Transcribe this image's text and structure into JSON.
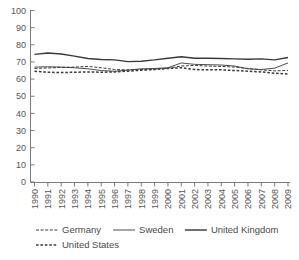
{
  "chart_data": {
    "type": "line",
    "title": "",
    "subtitle": "",
    "xlabel": "",
    "ylabel": "",
    "ylim": [
      0,
      100
    ],
    "ytick_values": [
      0,
      10,
      20,
      30,
      40,
      50,
      60,
      70,
      80,
      90,
      100
    ],
    "ytick_labels": [
      "0",
      "10",
      "20",
      "30",
      "40",
      "50",
      "60",
      "70",
      "80",
      "90",
      "100"
    ],
    "grid": false,
    "legend_position": "bottom",
    "categories": [
      "1990",
      "1991",
      "1992",
      "1993",
      "1994",
      "1995",
      "1996",
      "1997",
      "1998",
      "1999",
      "2000",
      "2001",
      "2002",
      "2003",
      "2004",
      "2005",
      "2006",
      "2007",
      "2008",
      "2009"
    ],
    "x": [
      1990,
      1991,
      1992,
      1993,
      1994,
      1995,
      1996,
      1997,
      1998,
      1999,
      2000,
      2001,
      2002,
      2003,
      2004,
      2005,
      2006,
      2007,
      2008,
      2009
    ],
    "series": [
      {
        "name": "Germany",
        "style": "dashed-thin",
        "color": "#3a3a3a",
        "values": [
          66.2,
          66.5,
          66.8,
          67.0,
          67.4,
          66.6,
          65.6,
          65.4,
          65.6,
          65.8,
          66.4,
          67.6,
          68.0,
          67.6,
          67.4,
          67.0,
          66.2,
          65.4,
          64.8,
          65.0
        ]
      },
      {
        "name": "Sweden",
        "style": "solid-thin",
        "color": "#3a3a3a",
        "values": [
          67.0,
          67.2,
          67.0,
          66.6,
          66.0,
          65.0,
          64.6,
          65.2,
          66.0,
          66.2,
          66.6,
          69.4,
          68.6,
          68.4,
          68.2,
          67.6,
          66.0,
          65.6,
          66.4,
          69.4
        ]
      },
      {
        "name": "United Kingdom",
        "style": "solid-thick",
        "color": "#2b2b2b",
        "values": [
          74.4,
          75.2,
          74.6,
          73.4,
          72.0,
          71.4,
          71.2,
          70.2,
          70.4,
          71.2,
          72.2,
          73.0,
          72.2,
          72.2,
          72.0,
          71.8,
          71.6,
          71.8,
          71.2,
          72.6
        ]
      },
      {
        "name": "United States",
        "style": "dotted-thick",
        "color": "#2b2b2b",
        "values": [
          64.6,
          64.0,
          63.8,
          64.0,
          64.2,
          64.0,
          64.2,
          64.6,
          65.2,
          65.6,
          66.2,
          66.6,
          65.6,
          65.4,
          65.4,
          65.0,
          64.6,
          64.2,
          63.4,
          63.0
        ]
      }
    ],
    "legend": [
      {
        "label": "Germany",
        "style": "dashed-thin"
      },
      {
        "label": "Sweden",
        "style": "solid-thin"
      },
      {
        "label": "United Kingdom",
        "style": "solid-thick"
      },
      {
        "label": "United States",
        "style": "dotted-thick"
      }
    ]
  }
}
